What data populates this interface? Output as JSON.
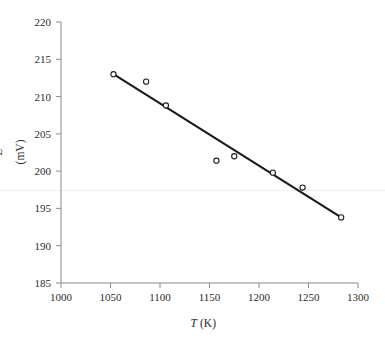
{
  "chart_data": {
    "type": "scatter",
    "title": "",
    "xlabel_var": "T",
    "xlabel_unit": "(K)",
    "ylabel_var": "E",
    "ylabel_unit": "(mV)",
    "xlim": [
      1000,
      1300
    ],
    "ylim": [
      185,
      220
    ],
    "xticks": [
      1000,
      1050,
      1100,
      1150,
      1200,
      1250,
      1300
    ],
    "yticks": [
      185,
      190,
      195,
      200,
      205,
      210,
      215,
      220
    ],
    "xtick_labels": [
      "1000",
      "1050",
      "1100",
      "1150",
      "1200",
      "1250",
      "1300"
    ],
    "ytick_labels": [
      "185",
      "190",
      "195",
      "200",
      "205",
      "210",
      "215",
      "220"
    ],
    "grid": false,
    "legend": "none",
    "marker_style": "open-circle",
    "series": [
      {
        "name": "measured",
        "x": [
          1053,
          1086,
          1106,
          1157,
          1175,
          1214,
          1244,
          1283
        ],
        "y": [
          213.0,
          212.0,
          208.8,
          201.4,
          202.0,
          199.8,
          197.8,
          193.8
        ]
      }
    ],
    "trendline": {
      "name": "linear fit",
      "x": [
        1053,
        1283
      ],
      "y": [
        213.0,
        193.8
      ],
      "slope": -0.0835,
      "intercept": 300.9
    },
    "colors": {
      "marker_stroke": "#1f1f1f",
      "marker_fill": "#ffffff",
      "line": "#1a1a1a",
      "axis": "#8a8a8a",
      "text": "#2b2b2b",
      "background": "#ffffff"
    }
  }
}
